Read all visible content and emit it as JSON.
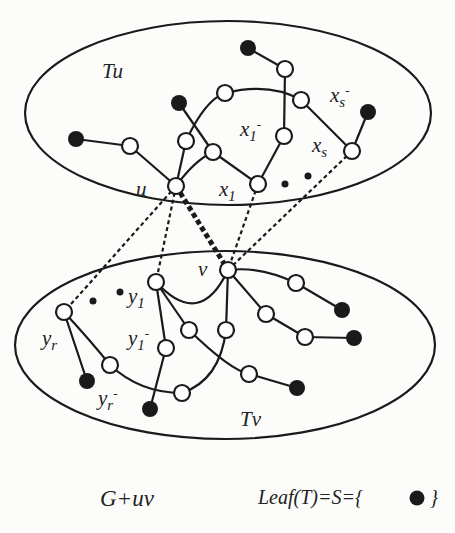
{
  "diagram": {
    "type": "graph-tree-illustration",
    "colors": {
      "ink": "#1a1a1a",
      "background": "#fcfcfa",
      "open_node_fill": "#ffffff",
      "leaf_fill": "#1a1a1a"
    },
    "regions": [
      {
        "id": "Tu",
        "label": "Tu",
        "cx": 228,
        "cy": 112,
        "rx": 203,
        "ry": 92
      },
      {
        "id": "Tv",
        "label": "Tv",
        "cx": 225,
        "cy": 344,
        "rx": 210,
        "ry": 94
      }
    ],
    "labels": {
      "u": "u",
      "v": "v",
      "x1": "x1",
      "x1_minus": "x1",
      "xs": "xs",
      "xs_minus": "xs",
      "y1": "y1",
      "y1_minus": "y1",
      "yr": "yr",
      "yr_minus": "yr",
      "minus_sup": "-",
      "tu": "Tu",
      "tv": "Tv"
    },
    "caption": {
      "left": "G+uv",
      "right": "Leaf(T)=S={",
      "right_close": "}"
    },
    "legend": {
      "leaf_symbol": "filled-circle",
      "meaning": "Leaf(T)=S"
    }
  }
}
